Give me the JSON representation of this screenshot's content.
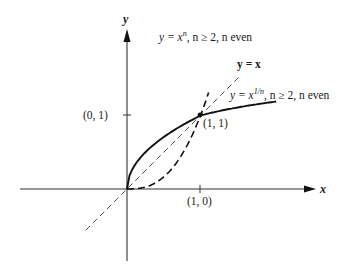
{
  "figure": {
    "axes": {
      "x_label": "x",
      "y_label": "y",
      "origin_px": [
        127,
        189
      ],
      "unit_px": 73.5
    },
    "points": [
      {
        "label": "(0, 1)",
        "x": 0,
        "y": 1
      },
      {
        "label": "(1, 1)",
        "x": 1,
        "y": 1
      },
      {
        "label": "(1, 0)",
        "x": 1,
        "y": 0
      }
    ],
    "curves": [
      {
        "name": "power-curve",
        "label_pre": "y = x",
        "label_sup": "n",
        "label_post": ", n ≥ 2, n even",
        "style": "dashed-bold",
        "exponent": 2.6,
        "x_range": [
          0,
          1.11
        ]
      },
      {
        "name": "identity-line",
        "label": "y = x",
        "style": "dashed-thin",
        "x_range": [
          -0.56,
          1.53
        ]
      },
      {
        "name": "root-curve",
        "label_pre": "y = x",
        "label_sup": "1/n",
        "label_post": ", n ≥ 2, n even",
        "style": "solid-bold",
        "exponent": 0.5,
        "x_range": [
          0,
          2.03
        ]
      }
    ]
  },
  "chart_data": {
    "type": "line",
    "title": "",
    "xlabel": "x",
    "ylabel": "y",
    "series": [
      {
        "name": "y = x^n, n ≥ 2, n even",
        "style": "dashed",
        "x": [
          0,
          0.25,
          0.5,
          0.75,
          1,
          1.11
        ],
        "y": [
          0,
          0.03,
          0.15,
          0.45,
          1,
          1.92
        ]
      },
      {
        "name": "y = x",
        "style": "thin dashed",
        "x": [
          -0.56,
          0,
          1,
          1.53
        ],
        "y": [
          -0.56,
          0,
          1,
          1.53
        ]
      },
      {
        "name": "y = x^(1/n), n ≥ 2, n even",
        "style": "solid",
        "x": [
          0,
          0.25,
          0.5,
          1,
          1.5,
          2.03
        ],
        "y": [
          0,
          0.5,
          0.67,
          1,
          1.12,
          1.19
        ]
      }
    ],
    "annotations": [
      "(0, 1)",
      "(1, 1)",
      "(1, 0)"
    ],
    "grid": false
  }
}
